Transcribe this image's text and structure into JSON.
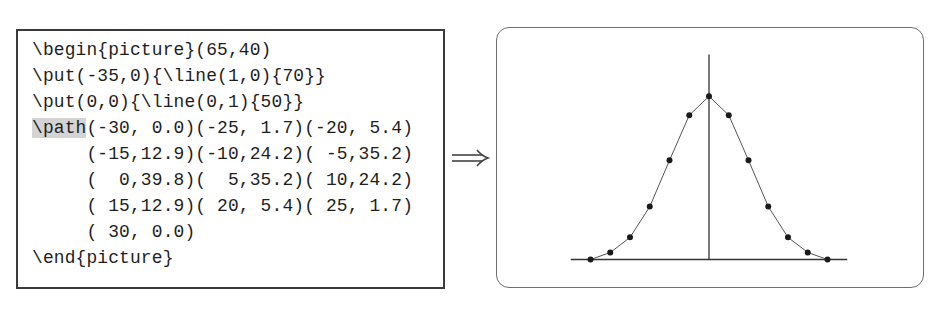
{
  "code": {
    "lines": [
      {
        "prefix": "",
        "highlight": "",
        "text": "\\begin{picture}(65,40)"
      },
      {
        "prefix": "",
        "highlight": "",
        "text": "\\put(-35,0){\\line(1,0){70}}"
      },
      {
        "prefix": "",
        "highlight": "",
        "text": "\\put(0,0){\\line(0,1){50}}"
      },
      {
        "prefix": "",
        "highlight": "\\path",
        "text": "(-30, 0.0)(-25, 1.7)(-20, 5.4)"
      },
      {
        "prefix": "     ",
        "highlight": "",
        "text": "(-15,12.9)(-10,24.2)( -5,35.2)"
      },
      {
        "prefix": "     ",
        "highlight": "",
        "text": "(  0,39.8)(  5,35.2)( 10,24.2)"
      },
      {
        "prefix": "     ",
        "highlight": "",
        "text": "( 15,12.9)( 20, 5.4)( 25, 1.7)"
      },
      {
        "prefix": "     ",
        "highlight": "",
        "text": "( 30, 0.0)"
      },
      {
        "prefix": "",
        "highlight": "",
        "text": "\\end{picture}"
      }
    ]
  },
  "arrow": {
    "icon": "implies-arrow-icon",
    "glyph": "⟹"
  },
  "chart_data": {
    "type": "line",
    "title": "",
    "xlabel": "",
    "ylabel": "",
    "picture_size": [
      65,
      40
    ],
    "axes": {
      "horizontal_line": {
        "start": [
          -35,
          0
        ],
        "direction": [
          1,
          0
        ],
        "length": 70
      },
      "vertical_line": {
        "start": [
          0,
          0
        ],
        "direction": [
          0,
          1
        ],
        "length": 50
      }
    },
    "x": [
      -30,
      -25,
      -20,
      -15,
      -10,
      -5,
      0,
      5,
      10,
      15,
      20,
      25,
      30
    ],
    "series": [
      {
        "name": "path",
        "values": [
          0.0,
          1.7,
          5.4,
          12.9,
          24.2,
          35.2,
          39.8,
          35.2,
          24.2,
          12.9,
          5.4,
          1.7,
          0.0
        ],
        "markers": true
      }
    ],
    "xlim": [
      -35,
      35
    ],
    "ylim": [
      0,
      50
    ],
    "grid": false,
    "legend": "none",
    "colors": {
      "line": "#555555",
      "marker": "#1a1a1a",
      "axis": "#333333"
    }
  }
}
